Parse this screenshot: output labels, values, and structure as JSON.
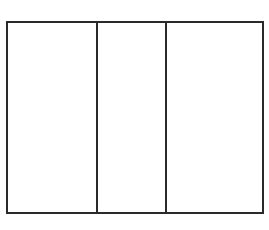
{
  "diagram": {
    "type": "three-panel-rectangle",
    "stroke_color": "#2a2a2a",
    "background_color": "#ffffff",
    "stroke_width": 2,
    "frame": {
      "x": 7,
      "y": 22,
      "width": 256,
      "height": 191
    },
    "dividers_x": [
      97,
      166
    ],
    "panels": [
      {
        "index": 0,
        "label": ""
      },
      {
        "index": 1,
        "label": ""
      },
      {
        "index": 2,
        "label": ""
      }
    ]
  }
}
